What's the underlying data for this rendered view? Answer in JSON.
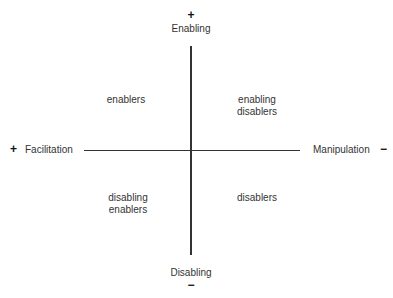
{
  "axes": {
    "top": {
      "sign": "+",
      "label": "Enabling"
    },
    "bottom": {
      "sign": "−",
      "label": "Disabling"
    },
    "left": {
      "sign": "+",
      "label": "Facilitation"
    },
    "right": {
      "sign": "−",
      "label": "Manipulation"
    }
  },
  "quadrants": {
    "top_left": {
      "lines": [
        "enablers"
      ]
    },
    "top_right": {
      "lines": [
        "enabling",
        "disablers"
      ]
    },
    "bottom_left": {
      "lines": [
        "disabling",
        "enablers"
      ]
    },
    "bottom_right": {
      "lines": [
        "disablers"
      ]
    }
  },
  "colors": {
    "axis": "#333333",
    "text": "#333333"
  }
}
